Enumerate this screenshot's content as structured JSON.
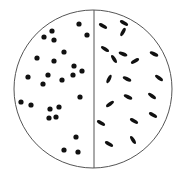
{
  "diagram": {
    "colors": {
      "outline": "#555555",
      "cell": "#111111",
      "background": "#ffffff"
    },
    "circle": {
      "cx": 93,
      "cy": 89,
      "r": 79
    },
    "divider": {
      "x": 94
    },
    "left_half": {
      "shape": "dot",
      "label": "cocci",
      "dots": [
        [
          79,
          24
        ],
        [
          52,
          31
        ],
        [
          44,
          37
        ],
        [
          54,
          40
        ],
        [
          87,
          35
        ],
        [
          64,
          52
        ],
        [
          37,
          58
        ],
        [
          54,
          61
        ],
        [
          74,
          66
        ],
        [
          82,
          71
        ],
        [
          28,
          77
        ],
        [
          48,
          75
        ],
        [
          73,
          75
        ],
        [
          62,
          80
        ],
        [
          43,
          84
        ],
        [
          80,
          97
        ],
        [
          21,
          102
        ],
        [
          31,
          105
        ],
        [
          59,
          107
        ],
        [
          50,
          109
        ],
        [
          56,
          117
        ],
        [
          49,
          118
        ],
        [
          76,
          137
        ],
        [
          64,
          150
        ],
        [
          78,
          152
        ]
      ]
    },
    "right_half": {
      "shape": "rod",
      "label": "bacilli",
      "rods": [
        [
          103,
          26,
          30
        ],
        [
          124,
          23,
          30
        ],
        [
          123,
          32,
          -62
        ],
        [
          105,
          49,
          32
        ],
        [
          123,
          54,
          22
        ],
        [
          114,
          59,
          58
        ],
        [
          135,
          61,
          -30
        ],
        [
          154,
          54,
          25
        ],
        [
          109,
          79,
          -65
        ],
        [
          127,
          79,
          25
        ],
        [
          159,
          78,
          35
        ],
        [
          128,
          97,
          25
        ],
        [
          152,
          96,
          35
        ],
        [
          110,
          104,
          -35
        ],
        [
          153,
          115,
          30
        ],
        [
          101,
          123,
          30
        ],
        [
          134,
          121,
          30
        ],
        [
          133,
          140,
          58
        ],
        [
          109,
          144,
          30
        ]
      ]
    }
  }
}
